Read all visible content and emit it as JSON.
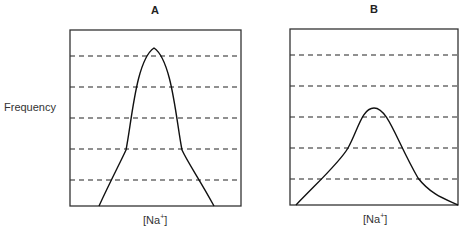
{
  "panels": [
    {
      "id": "A",
      "title": "A",
      "xlabel": "[Na+]",
      "box": {
        "x": 70,
        "y": 30,
        "w": 171,
        "h": 176
      },
      "curve": "M 99 206 C 112 178, 120 163, 126 150 C 132 120, 136 60, 154 48 C 172 60, 176 120, 182 150 C 188 163, 200 180, 214 206",
      "peak": {
        "x": 154,
        "y": 48
      }
    },
    {
      "id": "B",
      "title": "B",
      "xlabel": "[Na+]",
      "box": {
        "x": 290,
        "y": 29,
        "w": 168,
        "h": 176
      },
      "curve": "M 296 205 C 320 180, 340 162, 348 148 C 358 130, 362 108, 374 108 C 388 108, 396 140, 418 178 C 432 196, 448 200, 458 205",
      "peak": {
        "x": 374,
        "y": 108
      }
    }
  ],
  "ylabel": "Frequency",
  "gridlines_y": [
    56,
    87,
    118,
    149,
    180
  ],
  "chart_data": [
    {
      "type": "line",
      "title": "A",
      "xlabel": "[Na+]",
      "ylabel": "Frequency",
      "description": "Narrow, tall bell-shaped distribution centered in the range",
      "grid": "horizontal dashed lines, 5 levels",
      "peak_level": 5.3,
      "levels": 6
    },
    {
      "type": "line",
      "title": "B",
      "xlabel": "[Na+]",
      "ylabel": "Frequency",
      "description": "Broad, shorter distribution peaking around level 3.3 of 6",
      "grid": "horizontal dashed lines, 5 levels",
      "peak_level": 3.3,
      "levels": 6
    }
  ],
  "style": {
    "line_color": "#111111",
    "grid_color": "#222222"
  }
}
